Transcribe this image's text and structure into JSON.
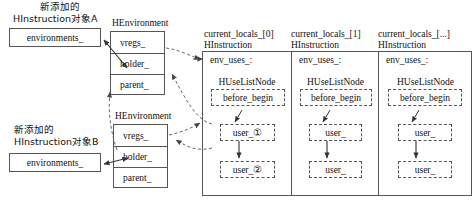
{
  "diagram": {
    "title_note": "",
    "colors": {
      "stroke": "#555555",
      "text": "#111111",
      "background": "#ffffff",
      "dashed_arrow": "#666666"
    },
    "left_objects": [
      {
        "caption_line1": "新添加的",
        "caption_line2": "HInstruction对象A",
        "field": "environments_"
      },
      {
        "caption_line1": "新添加的",
        "caption_line2": "HInstruction对象B",
        "field": "environments_"
      }
    ],
    "environments": [
      {
        "title": "HEnvironment",
        "fields": [
          "vregs_",
          "holder_",
          "parent_"
        ]
      },
      {
        "title": "HEnvironment",
        "fields": [
          "vregs_",
          "holder_",
          "parent_"
        ]
      }
    ],
    "panels": [
      {
        "title_line1": "current_locals_[0]",
        "title_line2": "HInstruction",
        "env_uses_label": "env_uses_:",
        "node_type": "HUseListNode",
        "head_node": "before_begin",
        "users": [
          "user_①",
          "user_②"
        ]
      },
      {
        "title_line1": "current_locals_[1]",
        "title_line2": "HInstruction",
        "env_uses_label": "env_uses_:",
        "node_type": "HUseListNode",
        "head_node": "before_begin",
        "users": [
          "user_",
          "user_"
        ]
      },
      {
        "title_line1": "current_locals_[...]",
        "title_line2": "HInstruction",
        "env_uses_label": "env_uses_:",
        "node_type": "HUseListNode",
        "head_node": "before_begin",
        "users": [
          "user_",
          "user_"
        ]
      }
    ]
  }
}
